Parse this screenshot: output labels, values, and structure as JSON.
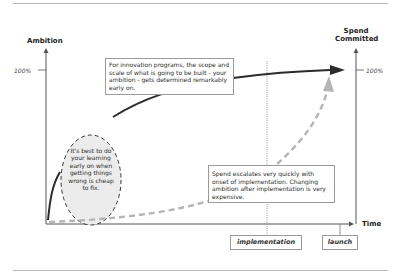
{
  "diagram": {
    "y_axis_left": {
      "label": "Ambition",
      "tick_label": "100%"
    },
    "y_axis_right": {
      "label_line1": "Spend",
      "label_line2": "Committed",
      "tick_label": "100%"
    },
    "x_axis": {
      "label": "Time"
    },
    "phases": [
      {
        "label": "implementation"
      },
      {
        "label": "launch"
      }
    ],
    "notes": {
      "ambition_note": "For innovation programs, the scope and scale of what is going to be built - your ambition - gets determined remarkably early on.",
      "learning_note": "It's best to do your learning early on when getting things wrong is cheap to fix.",
      "spend_note": "Spend escalates very quickly with onset of implementation. Changing ambition after implementation is very expensive."
    },
    "series": [
      {
        "name": "Ambition",
        "style": "solid",
        "color": "#2b2b2b"
      },
      {
        "name": "Spend Committed",
        "style": "dashed",
        "color": "#b5b5b5"
      }
    ],
    "colors": {
      "axis": "#555555",
      "ellipse_fill": "#ececec",
      "box_border": "#9a9a9a"
    }
  }
}
